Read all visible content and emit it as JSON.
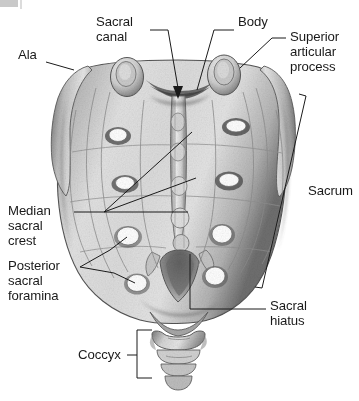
{
  "figure": {
    "view": "posterior",
    "background_color": "#ffffff",
    "ink_color": "#1a1a1a",
    "bone_light": "#e6e6e6",
    "bone_mid": "#b5b5b5",
    "bone_dark": "#6e6e6e",
    "bone_shadow": "#4a4a4a",
    "foramen_fill": "#ffffff"
  },
  "labels": {
    "ala": {
      "text": "Ala",
      "x": 18,
      "y": 55
    },
    "sacral_canal": {
      "text": "Sacral\ncanal",
      "line1": "Sacral",
      "line2": "canal",
      "x": 96,
      "y": 22
    },
    "body": {
      "text": "Body",
      "x": 238,
      "y": 22
    },
    "superior_articular_process": {
      "line1": "Superior",
      "line2": "articular",
      "line3": "process",
      "x": 288,
      "y": 30
    },
    "median_sacral_crest": {
      "line1": "Median",
      "line2": "sacral",
      "line3": "crest",
      "x": 10,
      "y": 208
    },
    "posterior_sacral_foramina": {
      "line1": "Posterior",
      "line2": "sacral",
      "line3": "foramina",
      "x": 10,
      "y": 263
    },
    "sacrum": {
      "text": "Sacrum",
      "x": 300,
      "y": 190
    },
    "sacral_hiatus": {
      "line1": "Sacral",
      "line2": "hiatus",
      "x": 272,
      "y": 303
    },
    "coccyx": {
      "text": "Coccyx",
      "x": 80,
      "y": 348
    }
  },
  "anatomy": {
    "foramina_pairs": 4,
    "left_foramina": [
      {
        "cx": 118,
        "cy": 135,
        "rx": 9,
        "ry": 6.5
      },
      {
        "cx": 125,
        "cy": 183,
        "rx": 9.5,
        "ry": 6.5
      },
      {
        "cx": 128,
        "cy": 236,
        "rx": 11,
        "ry": 9
      },
      {
        "cx": 137,
        "cy": 283,
        "rx": 10,
        "ry": 8.5
      }
    ],
    "right_foramina": [
      {
        "cx": 236,
        "cy": 126,
        "rx": 10,
        "ry": 6
      },
      {
        "cx": 229,
        "cy": 180,
        "rx": 10,
        "ry": 6.5
      },
      {
        "cx": 222,
        "cy": 234,
        "rx": 10,
        "ry": 9
      },
      {
        "cx": 215,
        "cy": 276,
        "rx": 10,
        "ry": 9
      }
    ],
    "superior_articular_processes": [
      {
        "cx": 127,
        "cy": 77,
        "rx": 16,
        "ry": 19
      },
      {
        "cx": 224,
        "cy": 75,
        "rx": 16,
        "ry": 20
      }
    ],
    "sacral_canal_arrow": {
      "x": 178,
      "y": 96
    },
    "coccyx_segments": 4
  },
  "leaders": {
    "ala": "M 46,62 L 72,70",
    "sacral_canal": "M 148,30 L 168,30 L 178,90",
    "body": "M 232,30 L 214,30 L 196,92",
    "superior_articular_process": "M 285,38 L 272,38 L 238,68",
    "median_sacral_crest": "M 72,212 L 188,212",
    "median_crest_fan_a": "M 104,212 L 192,132",
    "median_crest_fan_b": "M 104,212 L 196,178",
    "posterior_sacral_foramina_a": "M 79,267 L 108,250 L 126,236",
    "posterior_sacral_foramina_b": "M 79,267 L 112,272 L 134,283",
    "sacral_hiatus": "M 266,309 L 190,309 L 190,252",
    "sacrum_bracket": "M 300,95 L 306,96 L 262,288 L 256,287",
    "coccyx_bracket": "M 150,330 L 137,330 L 137,378 L 150,378",
    "coccyx_tick": "M 137,355 L 128,355"
  }
}
